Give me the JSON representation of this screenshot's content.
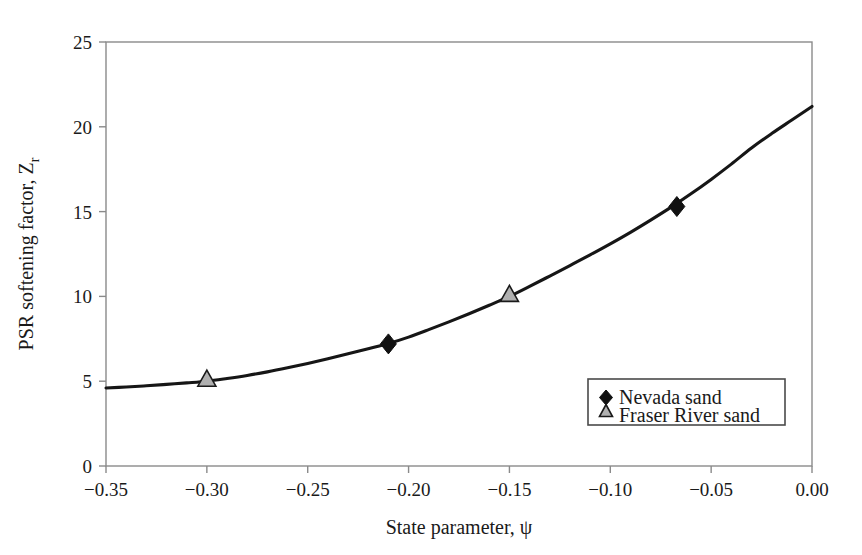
{
  "chart_data": {
    "type": "line",
    "title": "",
    "xlabel": "State parameter, ψ",
    "ylabel": "PSR softening factor, Z",
    "ylabel_sub": "r",
    "xlim": [
      -0.35,
      0.0
    ],
    "ylim": [
      0,
      25
    ],
    "grid": false,
    "legend_position": "inside-bottom-right",
    "xticks": [
      -0.35,
      -0.3,
      -0.25,
      -0.2,
      -0.15,
      -0.1,
      -0.05,
      0.0
    ],
    "xtick_labels": [
      "−0.35",
      "−0.30",
      "−0.25",
      "−0.20",
      "−0.15",
      "−0.10",
      "−0.05",
      "0.00"
    ],
    "yticks": [
      0,
      5,
      10,
      15,
      20,
      25
    ],
    "ytick_labels": [
      "0",
      "5",
      "10",
      "15",
      "20",
      "25"
    ],
    "series": [
      {
        "name": "fitted-curve",
        "marker": "none",
        "x": [
          -0.35,
          -0.34,
          -0.33,
          -0.32,
          -0.31,
          -0.3,
          -0.29,
          -0.28,
          -0.27,
          -0.26,
          -0.25,
          -0.24,
          -0.23,
          -0.22,
          -0.21,
          -0.2,
          -0.19,
          -0.18,
          -0.17,
          -0.16,
          -0.15,
          -0.14,
          -0.13,
          -0.12,
          -0.11,
          -0.1,
          -0.09,
          -0.08,
          -0.07,
          -0.06,
          -0.05,
          -0.04,
          -0.03,
          -0.02,
          -0.01,
          0.0
        ],
        "values": [
          4.6,
          4.66,
          4.73,
          4.81,
          4.9,
          5.0,
          5.16,
          5.34,
          5.55,
          5.79,
          6.05,
          6.33,
          6.62,
          6.92,
          7.22,
          7.6,
          8.04,
          8.5,
          8.98,
          9.48,
          10.0,
          10.59,
          11.2,
          11.82,
          12.45,
          13.1,
          13.78,
          14.5,
          15.25,
          16.05,
          16.9,
          17.8,
          18.75,
          19.6,
          20.4,
          21.2
        ]
      },
      {
        "name": "Nevada sand",
        "marker": "diamond",
        "marker_fill": "#111111",
        "points": [
          {
            "x": -0.21,
            "y": 7.2
          },
          {
            "x": -0.067,
            "y": 15.3
          }
        ]
      },
      {
        "name": "Fraser River sand",
        "marker": "triangle",
        "marker_fill": "#b0b0b0",
        "points": [
          {
            "x": -0.3,
            "y": 5.0
          },
          {
            "x": -0.15,
            "y": 10.0
          }
        ]
      }
    ],
    "legend": [
      {
        "label": "Nevada sand",
        "marker": "diamond"
      },
      {
        "label": "Fraser River sand",
        "marker": "triangle"
      }
    ]
  },
  "colors": {
    "curve": "#161616",
    "frame": "#8a8a8a",
    "text": "#1a1a1a",
    "triangle_fill": "#b0b0b0",
    "diamond_fill": "#111111",
    "background": "#ffffff"
  }
}
